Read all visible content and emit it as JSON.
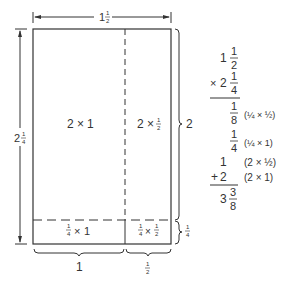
{
  "diagram": {
    "top_dimension": {
      "whole": "1",
      "num": "1",
      "den": "2"
    },
    "left_dimension": {
      "whole": "2",
      "num": "1",
      "den": "4"
    },
    "right_brace_upper": "2",
    "right_brace_lower": {
      "num": "1",
      "den": "4"
    },
    "bottom_brace_left": "1",
    "bottom_brace_right": {
      "num": "1",
      "den": "2"
    },
    "cells": {
      "top_left": {
        "a": "2",
        "op": "×",
        "b": "1"
      },
      "top_right": {
        "a": "2",
        "op": "×",
        "b_num": "1",
        "b_den": "2"
      },
      "bottom_left": {
        "a_num": "1",
        "a_den": "4",
        "op": "×",
        "b": "1"
      },
      "bottom_right": {
        "a_num": "1",
        "a_den": "4",
        "op": "×",
        "b_num": "1",
        "b_den": "2"
      }
    },
    "colors": {
      "line": "#333333",
      "background": "#ffffff"
    }
  },
  "computation": {
    "multiplicand": {
      "whole": "1",
      "num": "1",
      "den": "2"
    },
    "multiplier": {
      "sign": "×",
      "whole": "2",
      "num": "1",
      "den": "4"
    },
    "partials": [
      {
        "value_num": "1",
        "value_den": "8",
        "note": "(¼ × ½)"
      },
      {
        "value_num": "1",
        "value_den": "4",
        "note": "(¼ × 1)"
      },
      {
        "value": "1",
        "note": "(2 × ½)"
      },
      {
        "sign": "+",
        "value": "2",
        "note": "(2 × 1)"
      }
    ],
    "result": {
      "whole": "3",
      "num": "3",
      "den": "8"
    }
  }
}
